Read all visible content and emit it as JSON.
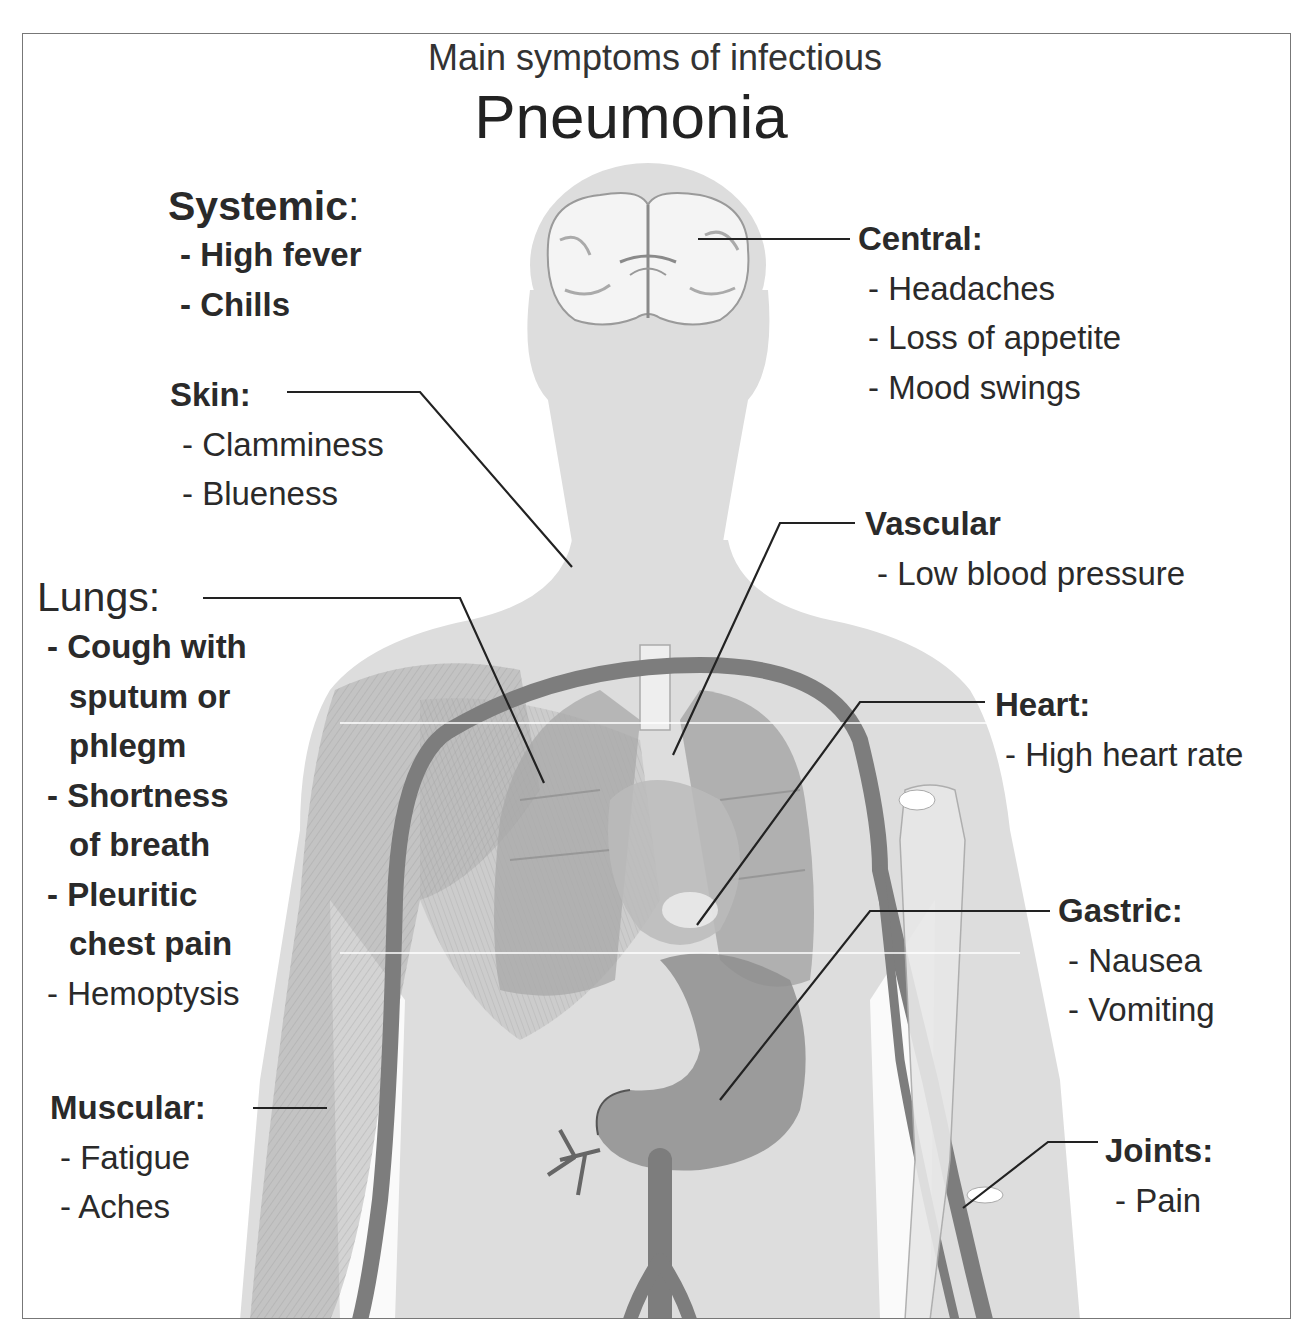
{
  "title": {
    "subtitle": "Main symptoms of infectious",
    "main": "Pneumonia"
  },
  "groups": {
    "systemic": {
      "heading": "Systemic",
      "colon": ":",
      "items": [
        "- High fever",
        "- Chills"
      ]
    },
    "central": {
      "heading": "Central:",
      "items": [
        "- Headaches",
        "- Loss of appetite",
        "- Mood swings"
      ]
    },
    "skin": {
      "heading": "Skin:",
      "items": [
        "- Clamminess",
        "- Blueness"
      ]
    },
    "vascular": {
      "heading": "Vascular",
      "items": [
        "- Low blood pressure"
      ]
    },
    "lungs": {
      "heading": "Lungs",
      "colon": ":",
      "items": [
        "- Cough with",
        "sputum or",
        "phlegm",
        "- Shortness",
        "of breath",
        "- Pleuritic",
        "chest pain",
        "- Hemoptysis"
      ]
    },
    "heart": {
      "heading": "Heart:",
      "items": [
        "- High heart rate"
      ]
    },
    "gastric": {
      "heading": "Gastric:",
      "items": [
        "- Nausea",
        "- Vomiting"
      ]
    },
    "muscular": {
      "heading": "Muscular:",
      "items": [
        "- Fatigue",
        "- Aches"
      ]
    },
    "joints": {
      "heading": "Joints:",
      "items": [
        "- Pain"
      ]
    }
  },
  "colors": {
    "body": "#dcdcdc",
    "organ": "#9a9a9a",
    "vessel": "#7d7d7d",
    "leader": "#222222",
    "frame": "#777777"
  }
}
